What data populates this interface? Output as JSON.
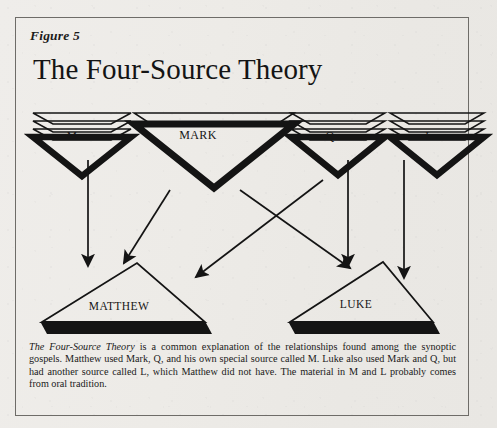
{
  "figure": {
    "label": "Figure 5",
    "title": "The Four-Source Theory"
  },
  "nodes": {
    "sources": [
      {
        "id": "M",
        "label": "M",
        "layers": 3,
        "shape": "stacked-inverted-triangle"
      },
      {
        "id": "MARK",
        "label": "MARK",
        "layers": 1,
        "shape": "stacked-inverted-triangle"
      },
      {
        "id": "Q",
        "label": "Q",
        "layers": 3,
        "shape": "stacked-inverted-triangle"
      },
      {
        "id": "L",
        "label": "L",
        "layers": 3,
        "shape": "stacked-inverted-triangle"
      }
    ],
    "gospels": [
      {
        "id": "MATTHEW",
        "label": "MATTHEW",
        "shape": "triangle-with-solid-base"
      },
      {
        "id": "LUKE",
        "label": "LUKE",
        "shape": "triangle-with-solid-base"
      }
    ]
  },
  "arrows": [
    {
      "from": "M",
      "to": "MATTHEW"
    },
    {
      "from": "MARK",
      "to": "MATTHEW"
    },
    {
      "from": "MARK",
      "to": "LUKE"
    },
    {
      "from": "Q",
      "to": "MATTHEW"
    },
    {
      "from": "Q",
      "to": "LUKE"
    },
    {
      "from": "L",
      "to": "LUKE"
    }
  ],
  "caption": {
    "title_italic": "The Four-Source Theory",
    "body": " is a common explanation of the relationships found among the synoptic gospels.  Matthew used Mark, Q, and his own special source called M.  Luke also used Mark and Q, but had another source called L, which Matthew did not have.  The material in M and L probably comes from oral tradition."
  },
  "colors": {
    "ink": "#141414",
    "paper": "#edebe7",
    "frame": "#6e6c68"
  }
}
